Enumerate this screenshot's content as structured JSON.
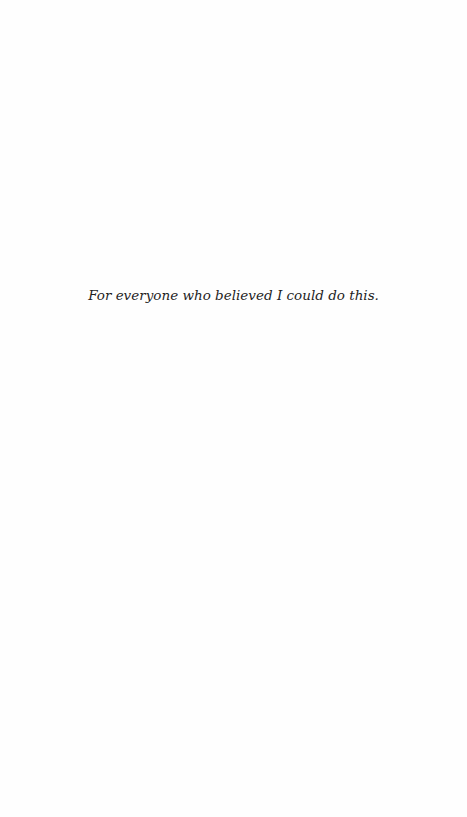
{
  "page": {
    "type": "dedication",
    "dedication_text": "For everyone who believed I could do this."
  }
}
